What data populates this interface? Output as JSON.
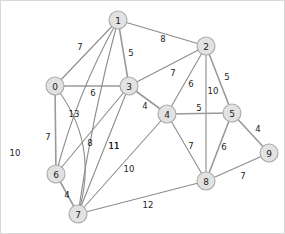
{
  "figure": {
    "type": "node-link-graph",
    "background_color": "#ffffff",
    "node_fill_color": "#e2e2e2",
    "node_stroke_color": "#a9a9a9",
    "edge_color": "#8c8c8c",
    "label_color": "#232323",
    "width": 285,
    "height": 234
  },
  "chart_data": {
    "type": "diagram",
    "title": "",
    "graph_kind": "undirected weighted graph",
    "node_count": 10,
    "edge_count": 22,
    "nodes": [
      {
        "id": "0",
        "label": "0",
        "x": 54,
        "y": 85,
        "r": 9
      },
      {
        "id": "1",
        "label": "1",
        "x": 117,
        "y": 19,
        "r": 9
      },
      {
        "id": "2",
        "label": "2",
        "x": 205,
        "y": 45,
        "r": 9
      },
      {
        "id": "3",
        "label": "3",
        "x": 128,
        "y": 85,
        "r": 9
      },
      {
        "id": "4",
        "label": "4",
        "x": 166,
        "y": 113,
        "r": 9
      },
      {
        "id": "5",
        "label": "5",
        "x": 231,
        "y": 112,
        "r": 9
      },
      {
        "id": "6",
        "label": "6",
        "x": 55,
        "y": 173,
        "r": 9
      },
      {
        "id": "7",
        "label": "7",
        "x": 77,
        "y": 213,
        "r": 9
      },
      {
        "id": "8",
        "label": "8",
        "x": 205,
        "y": 180,
        "r": 9
      },
      {
        "id": "9",
        "label": "9",
        "x": 268,
        "y": 152,
        "r": 9
      }
    ],
    "edges": [
      {
        "source": "0",
        "target": "1",
        "weight": 7,
        "label": "7",
        "label_x": 79,
        "label_y": 46,
        "curve": 0,
        "thick": false
      },
      {
        "source": "0",
        "target": "3",
        "weight": 6,
        "label": "6",
        "label_x": 92,
        "label_y": 92,
        "curve": 0,
        "thick": true
      },
      {
        "source": "0",
        "target": "6",
        "weight": 7,
        "label": "7",
        "label_x": 47,
        "label_y": 136,
        "curve": 0,
        "thick": true
      },
      {
        "source": "0",
        "target": "7",
        "weight": 10,
        "label": "10",
        "label_x": 14,
        "label_y": 152,
        "curve": -34,
        "thick": false
      },
      {
        "source": "1",
        "target": "2",
        "weight": 8,
        "label": "8",
        "label_x": 162,
        "label_y": 38,
        "curve": 0,
        "thick": false
      },
      {
        "source": "1",
        "target": "3",
        "weight": 5,
        "label": "5",
        "label_x": 130,
        "label_y": 52,
        "curve": 0,
        "thick": true
      },
      {
        "source": "1",
        "target": "6",
        "weight": 13,
        "label": "13",
        "label_x": 73,
        "label_y": 113,
        "curve": 11,
        "thick": false
      },
      {
        "source": "1",
        "target": "7",
        "weight": 11,
        "label": "11",
        "label_x": 113,
        "label_y": 145,
        "curve": 6,
        "thick": false
      },
      {
        "source": "2",
        "target": "3",
        "weight": 7,
        "label": "7",
        "label_x": 172,
        "label_y": 72,
        "curve": 0,
        "thick": false
      },
      {
        "source": "2",
        "target": "4",
        "weight": 6,
        "label": "6",
        "label_x": 190,
        "label_y": 83,
        "curve": 0,
        "thick": false
      },
      {
        "source": "2",
        "target": "5",
        "weight": 5,
        "label": "5",
        "label_x": 226,
        "label_y": 76,
        "curve": 0,
        "thick": true
      },
      {
        "source": "2",
        "target": "8",
        "weight": 10,
        "label": "10",
        "label_x": 212,
        "label_y": 90,
        "curve": 0,
        "thick": false
      },
      {
        "source": "3",
        "target": "4",
        "weight": 4,
        "label": "4",
        "label_x": 144,
        "label_y": 105,
        "curve": 0,
        "thick": true
      },
      {
        "source": "3",
        "target": "6",
        "weight": 8,
        "label": "8",
        "label_x": 89,
        "label_y": 142,
        "curve": 0,
        "thick": false
      },
      {
        "source": "3",
        "target": "7",
        "weight": 11,
        "label": "11",
        "label_x": 113,
        "label_y": 145,
        "curve": 0,
        "thick": false
      },
      {
        "source": "4",
        "target": "5",
        "weight": 5,
        "label": "5",
        "label_x": 198,
        "label_y": 107,
        "curve": 0,
        "thick": true
      },
      {
        "source": "4",
        "target": "7",
        "weight": 10,
        "label": "10",
        "label_x": 128,
        "label_y": 168,
        "curve": 0,
        "thick": false
      },
      {
        "source": "4",
        "target": "8",
        "weight": 7,
        "label": "7",
        "label_x": 190,
        "label_y": 145,
        "curve": 0,
        "thick": false
      },
      {
        "source": "5",
        "target": "8",
        "weight": 6,
        "label": "6",
        "label_x": 223,
        "label_y": 146,
        "curve": 0,
        "thick": true
      },
      {
        "source": "5",
        "target": "9",
        "weight": 4,
        "label": "4",
        "label_x": 257,
        "label_y": 128,
        "curve": 0,
        "thick": true
      },
      {
        "source": "6",
        "target": "7",
        "weight": 4,
        "label": "4",
        "label_x": 66,
        "label_y": 194,
        "curve": 0,
        "thick": true
      },
      {
        "source": "7",
        "target": "8",
        "weight": 12,
        "label": "12",
        "label_x": 147,
        "label_y": 204,
        "curve": 0,
        "thick": false
      },
      {
        "source": "8",
        "target": "9",
        "weight": 7,
        "label": "7",
        "label_x": 242,
        "label_y": 175,
        "curve": 0,
        "thick": false
      }
    ]
  }
}
